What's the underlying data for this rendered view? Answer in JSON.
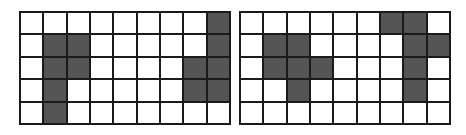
{
  "colors": {
    "fill": "#555555",
    "empty": "#ffffff",
    "line": "#1a1a1a"
  },
  "grids": [
    {
      "name": "left",
      "rows": 5,
      "cols": 9,
      "filled": [
        [
          0,
          8
        ],
        [
          1,
          1
        ],
        [
          1,
          2
        ],
        [
          1,
          8
        ],
        [
          2,
          1
        ],
        [
          2,
          2
        ],
        [
          2,
          7
        ],
        [
          2,
          8
        ],
        [
          3,
          1
        ],
        [
          3,
          7
        ],
        [
          3,
          8
        ],
        [
          4,
          1
        ]
      ]
    },
    {
      "name": "right",
      "rows": 5,
      "cols": 9,
      "filled": [
        [
          0,
          6
        ],
        [
          0,
          7
        ],
        [
          1,
          1
        ],
        [
          1,
          2
        ],
        [
          1,
          7
        ],
        [
          1,
          8
        ],
        [
          2,
          1
        ],
        [
          2,
          2
        ],
        [
          2,
          3
        ],
        [
          2,
          7
        ],
        [
          3,
          2
        ],
        [
          3,
          7
        ]
      ]
    }
  ]
}
